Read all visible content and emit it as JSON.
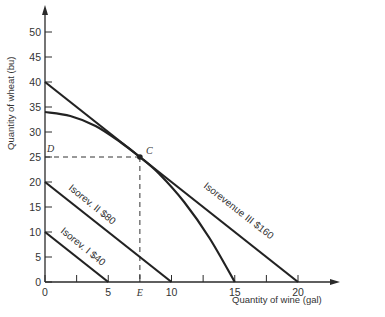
{
  "chart_data": {
    "type": "line",
    "title": "",
    "xlabel": "Quantity of wine (gal)",
    "ylabel": "Quantity of wheat (bu)",
    "xlim": [
      0,
      22
    ],
    "ylim": [
      0,
      52
    ],
    "x_ticks": [
      0,
      2.5,
      5,
      7.5,
      10,
      12.5,
      15,
      17.5,
      20
    ],
    "x_tick_labels": [
      "0",
      "",
      "5",
      "E",
      "10",
      "",
      "15",
      "",
      "20"
    ],
    "y_ticks": [
      0,
      5,
      10,
      15,
      20,
      25,
      30,
      35,
      40,
      45,
      50
    ],
    "y_tick_labels": [
      "0",
      "5",
      "10",
      "15",
      "20",
      "25",
      "30",
      "35",
      "40",
      "45",
      "50"
    ],
    "grid": false,
    "series": [
      {
        "name": "Isorev. I $40",
        "kind": "straight",
        "points": [
          [
            0,
            10
          ],
          [
            5,
            0
          ]
        ]
      },
      {
        "name": "Isorev. II $80",
        "kind": "straight",
        "points": [
          [
            0,
            20
          ],
          [
            10,
            0
          ]
        ]
      },
      {
        "name": "Isorevenue III $160",
        "kind": "straight",
        "points": [
          [
            0,
            40
          ],
          [
            20,
            0
          ]
        ]
      },
      {
        "name": "Production possibilities curve",
        "kind": "curve",
        "points": [
          [
            0,
            34
          ],
          [
            2,
            33.2
          ],
          [
            4,
            31.2
          ],
          [
            6,
            27.9
          ],
          [
            7.5,
            25
          ],
          [
            9,
            21.7
          ],
          [
            11,
            16
          ],
          [
            13,
            8.8
          ],
          [
            15,
            0
          ]
        ]
      }
    ],
    "annotations": [
      {
        "label": "C",
        "x": 7.5,
        "y": 25,
        "type": "point"
      },
      {
        "label": "D",
        "x": 0,
        "y": 25,
        "type": "axis-marker"
      },
      {
        "label": "E",
        "x": 7.5,
        "y": 0,
        "type": "axis-marker"
      }
    ],
    "guides": [
      {
        "from": [
          0,
          25
        ],
        "to": [
          7.5,
          25
        ],
        "style": "dashed"
      },
      {
        "from": [
          7.5,
          25
        ],
        "to": [
          7.5,
          0
        ],
        "style": "dashed"
      }
    ]
  },
  "labels": {
    "x_axis": "Quantity of wine (gal)",
    "y_axis": "Quantity of wheat (bu)",
    "point_c": "C",
    "point_d": "D",
    "point_e": "E",
    "isorev_1": "Isorev. I $40",
    "isorev_2": "Isorev. II $80",
    "isorev_3": "Isorevenue III $160"
  },
  "colors": {
    "ink": "#222222",
    "background": "#ffffff"
  }
}
